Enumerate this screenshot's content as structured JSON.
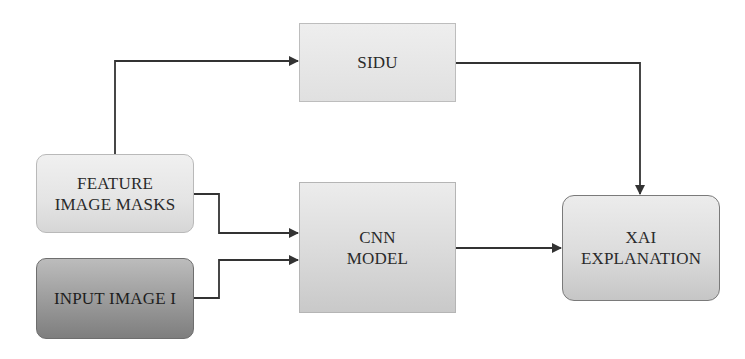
{
  "diagram": {
    "type": "flowchart",
    "nodes": [
      {
        "id": "sidu",
        "label_lines": [
          "SIDU"
        ],
        "shape": "rectangle",
        "fill": "#e6e6e6"
      },
      {
        "id": "feature_image_masks",
        "label_lines": [
          "FEATURE",
          "IMAGE MASKS"
        ],
        "shape": "rounded-rectangle",
        "fill": "#e4e4e4"
      },
      {
        "id": "input_image",
        "label_lines": [
          "INPUT IMAGE I"
        ],
        "shape": "rounded-rectangle",
        "fill": "#9a9a9a"
      },
      {
        "id": "cnn_model",
        "label_lines": [
          "CNN",
          "MODEL"
        ],
        "shape": "rectangle",
        "fill": "#d8d8d8"
      },
      {
        "id": "xai_explanation",
        "label_lines": [
          "XAI",
          "EXPLANATION"
        ],
        "shape": "rounded-rectangle",
        "fill": "#d8d8d8"
      }
    ],
    "edges": [
      {
        "from": "feature_image_masks",
        "to": "sidu"
      },
      {
        "from": "feature_image_masks",
        "to": "cnn_model"
      },
      {
        "from": "input_image",
        "to": "cnn_model"
      },
      {
        "from": "sidu",
        "to": "xai_explanation"
      },
      {
        "from": "cnn_model",
        "to": "xai_explanation"
      }
    ],
    "colors": {
      "line": "#333333",
      "text": "#2a2a2a"
    }
  }
}
